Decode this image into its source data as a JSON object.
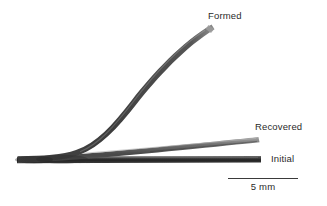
{
  "figure": {
    "background_color": "#ffffff",
    "width": 327,
    "height": 206,
    "caption_labels": {
      "formed": "Formed",
      "recovered": "Recovered",
      "initial": "Initial"
    },
    "scale_bar": {
      "label": "5 mm",
      "length_px": 70,
      "line_color": "#3a3a3a"
    },
    "specimens": [
      {
        "name": "formed",
        "label": "Formed",
        "description": "strongly bent rod curving upward to the right",
        "color_dark": "#3f3f3f",
        "color_light": "#8a8a8a",
        "thickness_px": 5,
        "start": [
          18,
          160
        ],
        "end": [
          214,
          27
        ]
      },
      {
        "name": "recovered",
        "label": "Recovered",
        "description": "partially sprung-back rod at a shallow angle",
        "color_dark": "#5a5a5a",
        "color_light": "#a6a6a6",
        "thickness_px": 5,
        "start": [
          18,
          160
        ],
        "end": [
          259,
          139
        ]
      },
      {
        "name": "initial",
        "label": "Initial",
        "description": "straight undeformed horizontal rod",
        "color_dark": "#2e2e2e",
        "color_light": "#6e6e6e",
        "thickness_px": 6,
        "start": [
          17,
          160
        ],
        "end": [
          261,
          159
        ]
      }
    ]
  }
}
